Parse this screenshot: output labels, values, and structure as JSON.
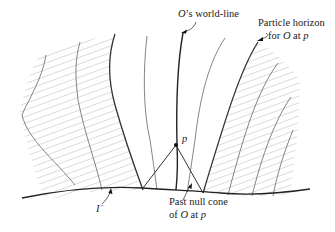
{
  "figure": {
    "type": "spacetime-diagram",
    "labels": {
      "worldline": {
        "prefix": "O",
        "suffix": "’s world-line"
      },
      "horizon_line1": "Particle horizon",
      "horizon_line2_pre": "for ",
      "horizon_line2_O": "O",
      "horizon_line2_mid": " at ",
      "horizon_line2_p": "p",
      "event_p": "p",
      "scri_minus": "I",
      "scri_minus_sup": "−",
      "cone_line1": "Past null cone",
      "cone_line2_pre": "of ",
      "cone_line2_O": "O",
      "cone_line2_mid": " at ",
      "cone_line2_p": "p"
    },
    "colors": {
      "line": "#333333",
      "hatch": "#9a9a9a",
      "text": "#222222"
    }
  }
}
